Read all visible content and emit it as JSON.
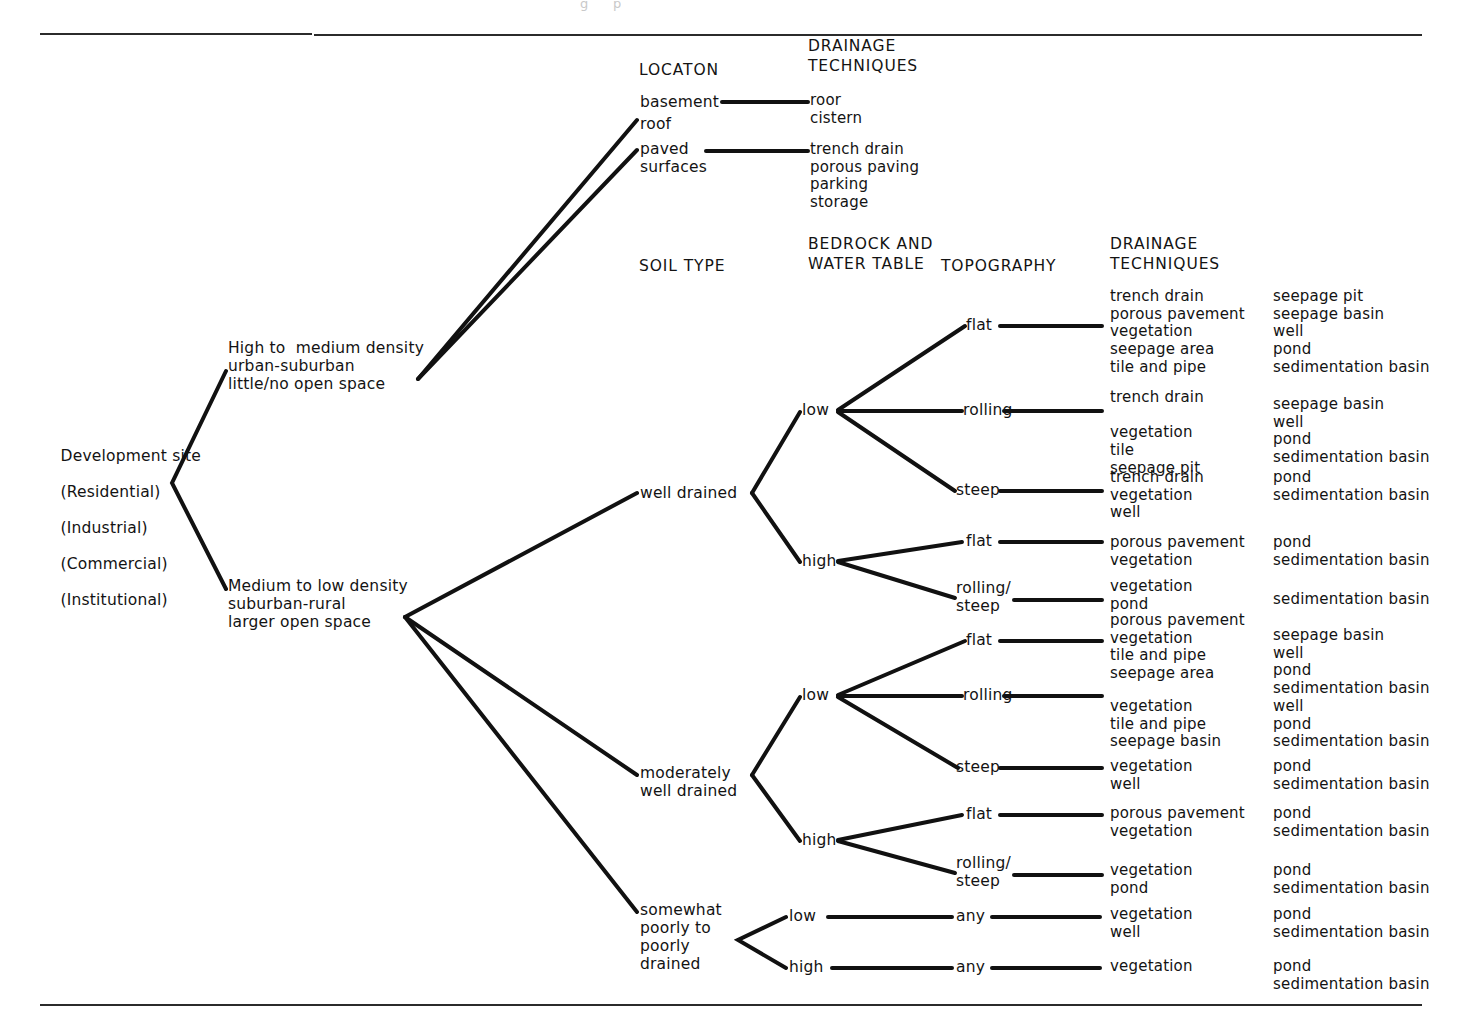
{
  "figure": {
    "partial_caption": "g      p",
    "root": {
      "lines": [
        "Development site",
        "(Residential)",
        "(Industrial)",
        "(Commercial)",
        "(Institutional)"
      ]
    }
  },
  "headers": {
    "location": "LOCATON",
    "drainage_techniques_top": "DRAINAGE\nTECHNIQUES",
    "soil_type": "SOIL TYPE",
    "bedrock_water_table": "BEDROCK AND\nWATER TABLE",
    "topography": "TOPOGRAPHY",
    "drainage_techniques_main": "DRAINAGE\nTECHNIQUES"
  },
  "density_branches": {
    "high_medium": "High to  medium density\nurban-suburban\nlittle/no open space",
    "medium_low": "Medium to low density\nsuburban-rural\nlarger open space"
  },
  "location_nodes": {
    "basement": "basement",
    "roof": "roof",
    "paved_surfaces": "paved\nsurfaces"
  },
  "location_techniques": {
    "basement_roof": "roor\ncistern",
    "paved": "trench drain\nporous paving\nparking\nstorage"
  },
  "soil_types": {
    "well_drained": "well drained",
    "moderately_well_drained": "moderately\nwell drained",
    "poorly_drained": "somewhat\npoorly to\npoorly\ndrained"
  },
  "water_table": {
    "wd_low": "low",
    "wd_high": "high",
    "mwd_low": "low",
    "mwd_high": "high",
    "pd_low": "low",
    "pd_high": "high"
  },
  "topography_nodes": {
    "wd_low_flat": "flat",
    "wd_low_rolling": "rolling",
    "wd_low_steep": "steep",
    "wd_high_flat": "flat",
    "wd_high_rolling_steep": "rolling/\nsteep",
    "mwd_low_flat": "flat",
    "mwd_low_rolling": "rolling",
    "mwd_low_steep": "steep",
    "mwd_high_flat": "flat",
    "mwd_high_rolling_steep": "rolling/\nsteep",
    "pd_low_any": "any",
    "pd_high_any": "any"
  },
  "techniques": {
    "wd_low_flat": "trench drain\nporous pavement\nvegetation\nseepage area\ntile and pipe",
    "wd_low_rolling": "trench drain\n\nvegetation\ntile\nseepage pit",
    "wd_low_steep": "trench drain\nvegetation\nwell",
    "wd_high_flat": "porous pavement\nvegetation",
    "wd_high_rolling_steep": "vegetation\npond",
    "mwd_low_flat": "porous pavement\nvegetation\ntile and pipe\nseepage area",
    "mwd_low_rolling": "vegetation\ntile and pipe\nseepage basin",
    "mwd_low_steep": "vegetation\nwell",
    "mwd_high_flat": "porous pavement\nvegetation",
    "mwd_high_rolling_steep": "vegetation\npond",
    "pd_low_any": "vegetation\nwell",
    "pd_high_any": "vegetation"
  },
  "storage": {
    "wd_low_flat": "seepage pit\nseepage basin\nwell\npond\nsedimentation basin",
    "wd_low_rolling": "seepage basin\nwell\npond\nsedimentation basin",
    "wd_low_steep": "pond\nsedimentation basin",
    "wd_high_flat": "pond\nsedimentation basin",
    "wd_high_rolling_steep": "sedimentation basin",
    "mwd_low_flat": "seepage basin\nwell\npond\nsedimentation basin",
    "mwd_low_rolling": "well\npond\nsedimentation basin",
    "mwd_low_steep": "pond\nsedimentation basin",
    "mwd_high_flat": "pond\nsedimentation basin",
    "mwd_high_rolling_steep": "pond\nsedimentation basin",
    "pd_low_any": "pond\nsedimentation basin",
    "pd_high_any": "pond\nsedimentation basin"
  }
}
